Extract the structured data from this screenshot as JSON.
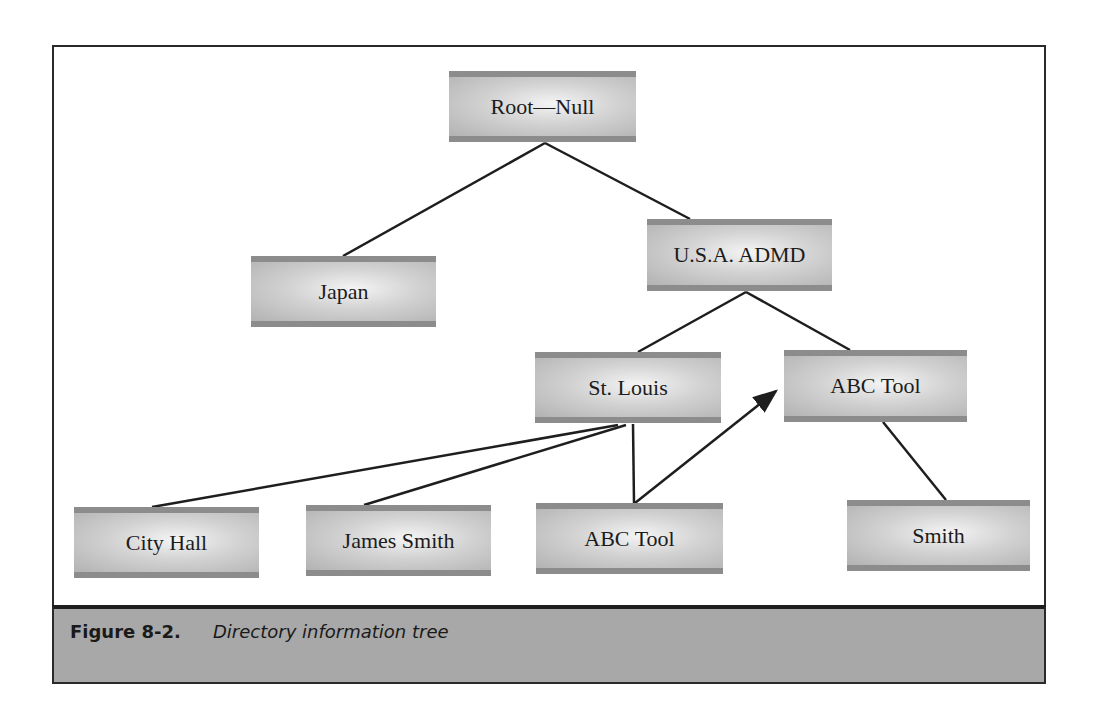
{
  "diagram": {
    "type": "tree",
    "nodes": [
      {
        "id": "root",
        "label": "Root—Null"
      },
      {
        "id": "japan",
        "label": "Japan"
      },
      {
        "id": "usa",
        "label": "U.S.A. ADMD"
      },
      {
        "id": "stlouis",
        "label": "St. Louis"
      },
      {
        "id": "abctool_top",
        "label": "ABC Tool"
      },
      {
        "id": "cityhall",
        "label": "City Hall"
      },
      {
        "id": "jamessmith",
        "label": "James Smith"
      },
      {
        "id": "abctool_leaf",
        "label": "ABC Tool"
      },
      {
        "id": "smith",
        "label": "Smith"
      }
    ],
    "edges": [
      {
        "from": "root",
        "to": "japan",
        "arrow": false
      },
      {
        "from": "root",
        "to": "usa",
        "arrow": false
      },
      {
        "from": "usa",
        "to": "stlouis",
        "arrow": false
      },
      {
        "from": "usa",
        "to": "abctool_top",
        "arrow": false
      },
      {
        "from": "stlouis",
        "to": "cityhall",
        "arrow": false
      },
      {
        "from": "stlouis",
        "to": "jamessmith",
        "arrow": false
      },
      {
        "from": "stlouis",
        "to": "abctool_leaf",
        "arrow": false
      },
      {
        "from": "abctool_leaf",
        "to": "abctool_top",
        "arrow": true
      },
      {
        "from": "abctool_top",
        "to": "smith",
        "arrow": false
      }
    ]
  },
  "caption": {
    "label": "Figure 8-2.",
    "text": "Directory information tree"
  },
  "colors": {
    "line": "#1e1e1e",
    "caption_band": "#a8a8a8",
    "node_band": "#8c8c8c"
  }
}
